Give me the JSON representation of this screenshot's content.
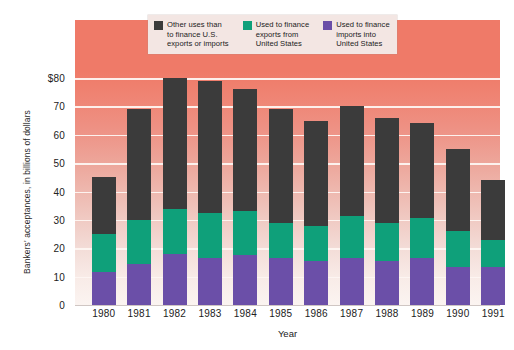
{
  "chart_data": {
    "type": "bar",
    "subtype": "stacked-bar",
    "title": "",
    "xlabel": "Year",
    "ylabel": "Bankers' acceptances,\nin billions of dollars",
    "categories": [
      "1980",
      "1981",
      "1982",
      "1983",
      "1984",
      "1985",
      "1986",
      "1987",
      "1988",
      "1989",
      "1990",
      "1991"
    ],
    "ylim": [
      0,
      80
    ],
    "ytick_labels": [
      "0",
      "10",
      "20",
      "30",
      "40",
      "50",
      "60",
      "70",
      "$80"
    ],
    "ytick_values": [
      0,
      10,
      20,
      30,
      40,
      50,
      60,
      70,
      80
    ],
    "grid": true,
    "grid_axis": "y",
    "legend_position": "top-center",
    "series": [
      {
        "name": "Used to finance\nimports into\nUnited States",
        "color": "#6b4fa8",
        "values": [
          11.5,
          14.5,
          18.0,
          16.5,
          17.5,
          16.5,
          15.5,
          16.5,
          15.5,
          16.5,
          13.5,
          13.5
        ]
      },
      {
        "name": "Used to finance\nexports from\nUnited States",
        "color": "#0fa07a",
        "values": [
          13.5,
          15.5,
          16.0,
          16.0,
          15.5,
          12.5,
          12.5,
          15.0,
          13.5,
          14.0,
          12.5,
          9.5
        ]
      },
      {
        "name": "Other uses than\nto finance U.S.\nexports or imports",
        "color": "#3b3b3b",
        "values": [
          20.0,
          39.0,
          46.0,
          46.5,
          43.0,
          40.0,
          37.0,
          38.5,
          37.0,
          33.5,
          29.0,
          21.0
        ]
      }
    ],
    "totals": [
      45.0,
      69.0,
      80.0,
      79.0,
      76.0,
      69.0,
      65.0,
      70.0,
      66.0,
      64.0,
      55.0,
      44.0
    ]
  },
  "legend": {
    "entries": [
      {
        "label": "Other uses than\nto finance U.S.\nexports or imports",
        "color": "#3b3b3b",
        "swatch_name": "legend-swatch-other-uses"
      },
      {
        "label": "Used to finance\nexports from\nUnited States",
        "color": "#0fa07a",
        "swatch_name": "legend-swatch-exports"
      },
      {
        "label": "Used to finance\nimports into\nUnited States",
        "color": "#6b4fa8",
        "swatch_name": "legend-swatch-imports"
      }
    ]
  },
  "axes": {
    "y_title": "Bankers' acceptances,\nin billions of dollars",
    "x_title": "Year"
  }
}
